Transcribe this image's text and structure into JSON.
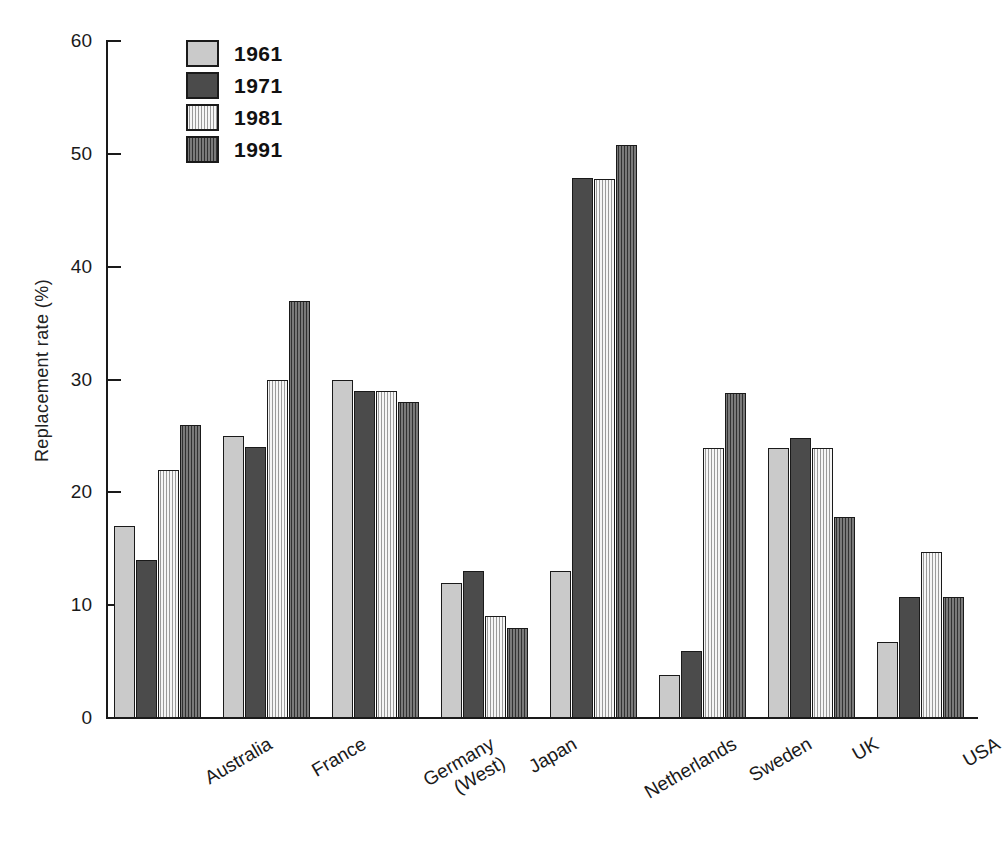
{
  "chart_data": {
    "type": "bar",
    "title": "",
    "subtitle": "",
    "xlabel": "",
    "ylabel": "Replacement rate (%)",
    "ylim": [
      0,
      60
    ],
    "yticks": [
      0,
      10,
      20,
      30,
      40,
      50,
      60
    ],
    "ytick_labels": [
      "0",
      "10",
      "20",
      "30",
      "40",
      "50",
      "60"
    ],
    "grid": false,
    "legend_position": "top-left-inside",
    "categories": [
      "Australia",
      "France",
      "Germany (West)",
      "Japan",
      "Netherlands",
      "Sweden",
      "UK",
      "USA"
    ],
    "category_lines": [
      [
        "Australia"
      ],
      [
        "France"
      ],
      [
        "Germany",
        "(West)"
      ],
      [
        "Japan"
      ],
      [
        "Netherlands"
      ],
      [
        "Sweden"
      ],
      [
        "UK"
      ],
      [
        "USA"
      ]
    ],
    "series": [
      {
        "name": "1961",
        "color": "#cacaca",
        "pattern": "solid-light",
        "values": [
          17,
          25,
          30,
          12,
          13,
          3.8,
          23.9,
          6.7
        ]
      },
      {
        "name": "1971",
        "color": "#4b4b4b",
        "pattern": "solid-dark",
        "values": [
          14,
          24,
          29,
          13,
          47.9,
          5.9,
          24.8,
          10.7
        ]
      },
      {
        "name": "1981",
        "color": "#c6c6c6",
        "pattern": "striped-light",
        "values": [
          22,
          30,
          29,
          9,
          47.8,
          23.9,
          23.9,
          14.7
        ]
      },
      {
        "name": "1991",
        "color": "#555555",
        "pattern": "striped-dark",
        "values": [
          26,
          37,
          28,
          8,
          50.8,
          28.8,
          17.8,
          10.7
        ]
      }
    ]
  },
  "legend": {
    "items": [
      {
        "label": "1961",
        "pattern": "solid-light"
      },
      {
        "label": "1971",
        "pattern": "solid-dark"
      },
      {
        "label": "1981",
        "pattern": "striped-light"
      },
      {
        "label": "1991",
        "pattern": "striped-dark"
      }
    ]
  },
  "axes": {
    "y_title": "Replacement rate (%)"
  }
}
